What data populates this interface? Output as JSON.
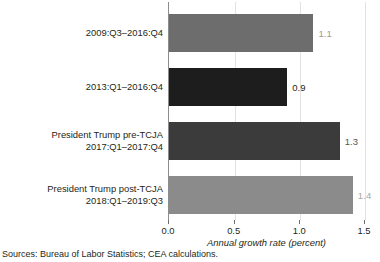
{
  "chart_data": {
    "type": "bar",
    "orientation": "horizontal",
    "title": "",
    "xlabel": "Annual growth rate (percent)",
    "ylabel": "",
    "xlim": [
      0.0,
      1.5
    ],
    "xticks": [
      "0.0",
      "0.5",
      "1.0",
      "1.5"
    ],
    "xtick_values": [
      0.0,
      0.5,
      1.0,
      1.5
    ],
    "grid": true,
    "legend": "none",
    "categories": [
      "2009:Q3–2016:Q4",
      "2013:Q1–2016:Q4",
      "President Trump pre-TCJA 2017:Q1–2017:Q4",
      "President Trump post-TCJA 2018:Q1–2019:Q3"
    ],
    "values": [
      1.1,
      0.9,
      1.3,
      1.4
    ],
    "bars": [
      {
        "label_line1": "2009:Q3–2016:Q4",
        "label_line2": "",
        "value": 1.1,
        "value_label": "1.1",
        "color": "#6d6d6d",
        "value_color": "#9a9a9a"
      },
      {
        "label_line1": "2013:Q1–2016:Q4",
        "label_line2": "",
        "value": 0.9,
        "value_label": "0.9",
        "color": "#1d1d1d",
        "value_color": "#231f20"
      },
      {
        "label_line1": "President Trump pre-TCJA",
        "label_line2": "2017:Q1–2017:Q4",
        "value": 1.3,
        "value_label": "1.3",
        "color": "#3b3b3b",
        "value_color": "#575757"
      },
      {
        "label_line1": "President Trump post-TCJA",
        "label_line2": "2018:Q1–2019:Q3",
        "value": 1.4,
        "value_label": "1.4",
        "color": "#8b8b8b",
        "value_color": "#a6a6a6"
      }
    ]
  },
  "axis": {
    "title": "Annual growth rate (percent)",
    "ticks": [
      "0.0",
      "0.5",
      "1.0",
      "1.5"
    ]
  },
  "footer": {
    "source": "Sources: Bureau of Labor Statistics; CEA calculations."
  },
  "colors": {
    "gridline": "#e2e2e2",
    "axis_line": "#8d8d8d",
    "text": "#231f20",
    "background": "#ffffff"
  }
}
